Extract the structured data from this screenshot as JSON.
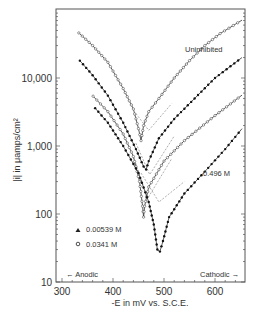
{
  "chart_data": {
    "type": "line",
    "title": "",
    "xlabel": "-E in mV vs. S.C.E.",
    "ylabel": "|i| in μamps/cm²",
    "x_ticks": [
      300,
      400,
      500,
      600
    ],
    "x_tick_labels": [
      "300",
      "400",
      "500",
      "600"
    ],
    "y_ticks": [
      10,
      100,
      1000,
      10000
    ],
    "y_tick_labels": [
      "10",
      "100",
      "1,000",
      "10,000"
    ],
    "xlim": [
      288,
      660
    ],
    "ylim": [
      10,
      100000
    ],
    "yscale": "log",
    "grid": false,
    "annotations": [
      {
        "text": "Uninhibited",
        "x": 540,
        "y": 28000
      },
      {
        "text": "0.496 M",
        "x": 570,
        "y": 190
      },
      {
        "text": "← Anodic",
        "x": 300,
        "y": 13
      },
      {
        "text": "Cathodic →",
        "x": 590,
        "y": 13
      }
    ],
    "legend": [
      {
        "marker": "filled-triangle",
        "label": "0.00539 M"
      },
      {
        "marker": "open-circle",
        "label": "0.0341 M"
      }
    ],
    "series": [
      {
        "name": "Uninhibited",
        "marker": "open",
        "x": [
          333,
          360,
          390,
          420,
          440,
          450,
          455,
          460,
          470,
          490,
          520,
          550,
          580,
          610,
          653
        ],
        "y": [
          46000,
          30000,
          17000,
          7000,
          3500,
          1800,
          1200,
          2000,
          3200,
          5000,
          10000,
          18000,
          30000,
          45000,
          71000
        ]
      },
      {
        "name": "0.00539 M",
        "marker": "filled",
        "x": [
          335,
          360,
          390,
          420,
          445,
          460,
          465,
          470,
          490,
          520,
          560,
          600,
          653
        ],
        "y": [
          18000,
          11000,
          5500,
          2200,
          900,
          500,
          450,
          600,
          1300,
          2500,
          5000,
          10000,
          20000
        ]
      },
      {
        "name": "0.0341 M",
        "marker": "open",
        "x": [
          361,
          390,
          420,
          440,
          452,
          458,
          460,
          462,
          470,
          500,
          540,
          600,
          653
        ],
        "y": [
          5400,
          3200,
          1500,
          700,
          300,
          130,
          90,
          130,
          250,
          600,
          1200,
          2800,
          5600
        ]
      },
      {
        "name": "0.496 M",
        "marker": "filled",
        "x": [
          365,
          390,
          420,
          450,
          470,
          480,
          487,
          492,
          498,
          510,
          540,
          580,
          620,
          653
        ],
        "y": [
          3600,
          2200,
          1000,
          400,
          150,
          70,
          30,
          28,
          40,
          90,
          200,
          420,
          900,
          1800
        ]
      }
    ],
    "tafel_lines": [
      {
        "x": [
          445,
          470,
          515
        ],
        "y": [
          3000,
          1700,
          4200
        ]
      },
      {
        "x": [
          445,
          472,
          520
        ],
        "y": [
          1100,
          380,
          1400
        ]
      },
      {
        "x": [
          440,
          468,
          515
        ],
        "y": [
          700,
          170,
          650
        ]
      },
      {
        "x": [
          455,
          490,
          540
        ],
        "y": [
          400,
          150,
          300
        ]
      }
    ]
  }
}
